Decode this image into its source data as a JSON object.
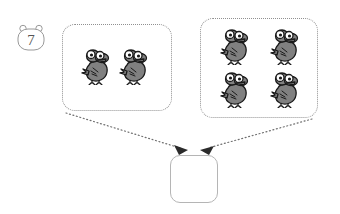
{
  "worksheet": {
    "question_number": "7",
    "badge_icon": "bear-head-badge-icon",
    "problem_type": "addition-with-pictures"
  },
  "groups": [
    {
      "id": "left-group",
      "name": "first-addend-group",
      "item_icon": "bird-icon",
      "count": 2,
      "border_style": "dotted"
    },
    {
      "id": "right-group",
      "name": "second-addend-group",
      "item_icon": "bird-icon",
      "count": 4,
      "border_style": "dotted"
    }
  ],
  "answer": {
    "name": "answer-box",
    "value": "",
    "placeholder": "",
    "border_style": "solid"
  },
  "arrows": [
    {
      "name": "arrow-left-to-answer",
      "style": "dotted",
      "from": "left-group",
      "to": "answer-box"
    },
    {
      "name": "arrow-right-to-answer",
      "style": "dotted",
      "from": "right-group",
      "to": "answer-box"
    }
  ],
  "colors": {
    "bird_body": "#808080",
    "bird_outline": "#1a1a1a",
    "bird_eye_white": "#ffffff",
    "box_border_dotted": "#909090",
    "box_border_solid": "#b5b5b5",
    "badge_stroke": "#999999",
    "badge_text": "#555555",
    "arrow_dot": "#707070",
    "arrow_head": "#2b2b2b",
    "background": "#ffffff"
  }
}
